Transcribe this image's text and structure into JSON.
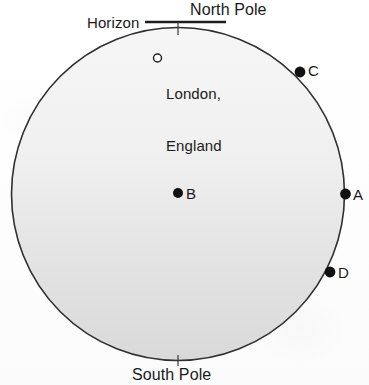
{
  "figure": {
    "type": "earth-globe-diagram",
    "background_color": "#fefefe",
    "outline_color": "#2b2b2b",
    "fill_top_color": "#f4f4f4",
    "fill_bottom_color": "#dadada",
    "marker_fill_color": "#111111"
  },
  "globe": {
    "center_x": 178,
    "center_y": 194,
    "radius": 167
  },
  "labels": {
    "north_pole": "North Pole",
    "south_pole": "South Pole",
    "horizon": "Horizon",
    "london_line1": "London,",
    "london_line2": "England"
  },
  "horizon_line": {
    "y": 22,
    "x_start": 145,
    "x_end": 226
  },
  "markers": [
    {
      "id": "london",
      "label": "",
      "style": "open-circle",
      "x": 157,
      "y": 58
    },
    {
      "id": "point-b",
      "label": "B",
      "style": "filled-dot",
      "x": 178,
      "y": 193
    },
    {
      "id": "point-c",
      "label": "C",
      "style": "filled-dot",
      "x": 300,
      "y": 72
    },
    {
      "id": "point-a",
      "label": "A",
      "style": "filled-dot",
      "x": 346,
      "y": 194
    },
    {
      "id": "point-d",
      "label": "D",
      "style": "filled-dot",
      "x": 330,
      "y": 272
    }
  ],
  "point_labels": {
    "a": "A",
    "b": "B",
    "c": "C",
    "d": "D"
  }
}
